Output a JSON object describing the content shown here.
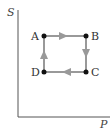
{
  "diagram": {
    "axes": {
      "y_label": "S",
      "x_label": "P"
    },
    "points": [
      {
        "name": "A",
        "x": 44,
        "y": 36
      },
      {
        "name": "B",
        "x": 86,
        "y": 36
      },
      {
        "name": "C",
        "x": 86,
        "y": 72
      },
      {
        "name": "D",
        "x": 44,
        "y": 72
      }
    ],
    "cycle": [
      "A→B",
      "B→C",
      "C→D",
      "D→A"
    ],
    "colors": {
      "axis": "#555555",
      "edge": "#999999",
      "point": "#111111"
    }
  }
}
